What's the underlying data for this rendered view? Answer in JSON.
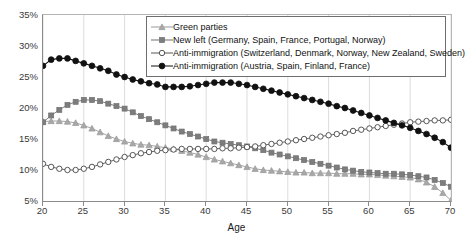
{
  "chart_data": {
    "type": "line",
    "title": "",
    "xlabel": "Age",
    "ylabel": "",
    "xlim": [
      20,
      70
    ],
    "ylim": [
      5,
      35
    ],
    "grid": "vertical-only",
    "legend_position": "top-center",
    "x_tick_labels": [
      "20",
      "25",
      "30",
      "35",
      "40",
      "45",
      "50",
      "55",
      "60",
      "65",
      "70"
    ],
    "y_tick_labels": [
      "5%",
      "10%",
      "15%",
      "20%",
      "25%",
      "30%",
      "35%"
    ],
    "x_ticks": [
      20,
      25,
      30,
      35,
      40,
      45,
      50,
      55,
      60,
      65,
      70
    ],
    "y_ticks": [
      5,
      10,
      15,
      20,
      25,
      30,
      35
    ],
    "x": [
      20,
      21,
      22,
      23,
      24,
      25,
      26,
      27,
      28,
      29,
      30,
      31,
      32,
      33,
      34,
      35,
      36,
      37,
      38,
      39,
      40,
      41,
      42,
      43,
      44,
      45,
      46,
      47,
      48,
      49,
      50,
      51,
      52,
      53,
      54,
      55,
      56,
      57,
      58,
      59,
      60,
      61,
      62,
      63,
      64,
      65,
      66,
      67,
      68,
      69,
      70
    ],
    "series": [
      {
        "name": "Green parties",
        "marker": "triangle",
        "color": "#9a9a9a",
        "fill": "#a8a8a8",
        "values": [
          17.8,
          17.9,
          17.9,
          17.8,
          17.6,
          17.2,
          16.7,
          16.1,
          15.5,
          15.0,
          14.6,
          14.3,
          14.1,
          14.0,
          13.8,
          13.6,
          13.4,
          13.1,
          12.8,
          12.5,
          12.1,
          11.7,
          11.4,
          11.1,
          10.8,
          10.5,
          10.2,
          10.0,
          9.9,
          9.8,
          9.7,
          9.6,
          9.6,
          9.5,
          9.5,
          9.5,
          9.4,
          9.4,
          9.4,
          9.3,
          9.3,
          9.2,
          9.1,
          9.0,
          8.9,
          8.8,
          8.5,
          8.0,
          7.3,
          6.3,
          5.1
        ]
      },
      {
        "name": "New left (Germany, Spain, France, Portugal, Norway)",
        "marker": "square",
        "color": "#707070",
        "fill": "#7d7d7d",
        "values": [
          17.7,
          18.8,
          19.7,
          20.5,
          21.0,
          21.3,
          21.3,
          21.1,
          20.7,
          20.3,
          19.9,
          19.3,
          18.7,
          18.2,
          17.7,
          17.2,
          16.7,
          16.2,
          15.8,
          15.4,
          15.0,
          14.6,
          14.4,
          14.2,
          14.0,
          13.8,
          13.5,
          13.2,
          12.8,
          12.5,
          12.2,
          11.9,
          11.6,
          11.3,
          11.0,
          10.7,
          10.4,
          10.1,
          9.9,
          9.7,
          9.6,
          9.5,
          9.4,
          9.4,
          9.3,
          9.2,
          9.0,
          8.8,
          8.4,
          7.9,
          7.3
        ]
      },
      {
        "name": "Anti-immigration (Switzerland, Denmark, Norway, New Zealand, Sweden)",
        "marker": "circle-open",
        "color": "#555555",
        "fill": "#ffffff",
        "values": [
          11.0,
          10.5,
          10.2,
          10.0,
          10.0,
          10.2,
          10.5,
          10.9,
          11.3,
          11.7,
          12.1,
          12.4,
          12.7,
          12.9,
          13.1,
          13.2,
          13.3,
          13.4,
          13.4,
          13.4,
          13.4,
          13.4,
          13.5,
          13.5,
          13.6,
          13.7,
          13.8,
          14.0,
          14.2,
          14.4,
          14.6,
          14.8,
          15.0,
          15.2,
          15.4,
          15.6,
          15.8,
          16.0,
          16.3,
          16.5,
          16.7,
          16.9,
          17.1,
          17.3,
          17.5,
          17.7,
          17.8,
          17.9,
          18.0,
          18.0,
          18.1
        ]
      },
      {
        "name": "Anti-immigration (Austria, Spain, Finland, France)",
        "marker": "circle-filled",
        "color": "#111111",
        "fill": "#111111",
        "values": [
          26.8,
          27.8,
          28.0,
          28.0,
          27.6,
          27.2,
          26.8,
          26.4,
          26.0,
          25.4,
          25.0,
          24.6,
          24.3,
          24.0,
          23.8,
          23.4,
          23.4,
          23.4,
          23.5,
          23.7,
          23.9,
          24.1,
          24.1,
          24.1,
          23.9,
          23.7,
          23.4,
          23.1,
          22.8,
          22.5,
          22.2,
          21.9,
          21.6,
          21.3,
          21.0,
          20.7,
          20.3,
          20.0,
          19.6,
          19.2,
          18.8,
          18.4,
          18.0,
          17.6,
          17.2,
          16.8,
          16.3,
          15.8,
          15.2,
          14.5,
          13.6
        ]
      }
    ]
  }
}
